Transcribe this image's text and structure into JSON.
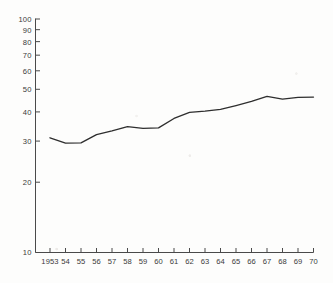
{
  "chart_data": {
    "type": "line",
    "title": "",
    "subtitle": "",
    "xlabel": "",
    "ylabel": "",
    "yscale": "log",
    "xscale": "linear",
    "grid": false,
    "legend": null,
    "legend_position": "none",
    "xlim": [
      1953,
      1970
    ],
    "ylim": [
      10,
      100
    ],
    "x": [
      1953,
      1954,
      1955,
      1956,
      1957,
      1958,
      1959,
      1960,
      1961,
      1962,
      1963,
      1964,
      1965,
      1966,
      1967,
      1968,
      1969,
      1970
    ],
    "values": [
      31.0,
      29.4,
      29.5,
      32.0,
      33.2,
      34.6,
      34.0,
      34.2,
      37.5,
      39.8,
      40.3,
      41.0,
      42.6,
      44.4,
      46.6,
      45.4,
      46.2,
      46.3
    ],
    "series": [
      {
        "name": "series-1",
        "values": [
          31.0,
          29.4,
          29.5,
          32.0,
          33.2,
          34.6,
          34.0,
          34.2,
          37.5,
          39.8,
          40.3,
          41.0,
          42.6,
          44.4,
          46.6,
          45.4,
          46.2,
          46.3
        ],
        "color": "#2e2e2e"
      }
    ],
    "yticks": [
      10,
      20,
      30,
      40,
      50,
      60,
      70,
      80,
      90,
      100
    ],
    "ytick_labels": [
      "10",
      "20",
      "30",
      "40",
      "50",
      "60",
      "70",
      "80",
      "90",
      "100"
    ],
    "xticks": [
      1953,
      1954,
      1955,
      1956,
      1957,
      1958,
      1959,
      1960,
      1961,
      1962,
      1963,
      1964,
      1965,
      1966,
      1967,
      1968,
      1969,
      1970
    ],
    "xtick_labels": [
      "1953",
      "54",
      "55",
      "56",
      "57",
      "58",
      "59",
      "60",
      "61",
      "62",
      "63",
      "64",
      "65",
      "66",
      "67",
      "68",
      "69",
      "70"
    ],
    "annotations": []
  },
  "figure": {
    "background_color": "#fdfdfc",
    "axis_color": "#4a4a4a",
    "line_color": "#2e2e2e"
  }
}
